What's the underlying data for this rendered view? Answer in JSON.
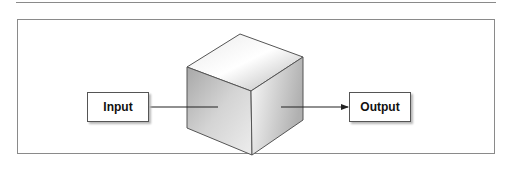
{
  "diagram": {
    "type": "black-box",
    "input_label": "Input",
    "output_label": "Output",
    "center_shape": "cube",
    "colors": {
      "border": "#555555",
      "frame": "#8a8a8a",
      "cube_light": "#f7f7f7",
      "cube_dark": "#a9a9a9"
    }
  }
}
